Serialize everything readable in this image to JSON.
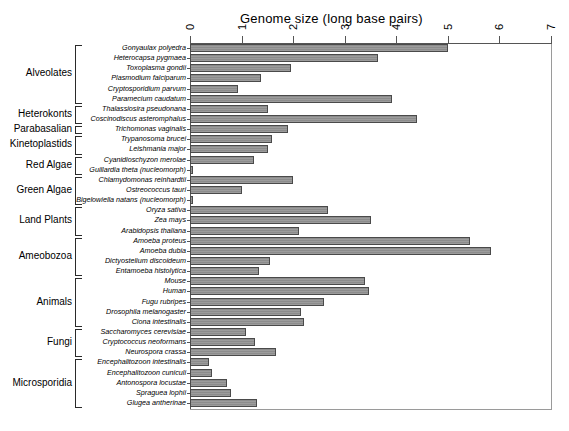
{
  "chart_data": {
    "type": "bar",
    "orientation": "horizontal",
    "title": "Genome size (long base pairs)",
    "xlabel": "",
    "ylabel": "",
    "xlim": [
      0,
      7
    ],
    "xticks": [
      0,
      1,
      2,
      3,
      4,
      5,
      6,
      7
    ],
    "xtick_labels": [
      "0",
      "1",
      "2",
      "3",
      "4",
      "5",
      "6",
      "7"
    ],
    "grid": false,
    "legend": "none",
    "bar_color": "#9c9c9c",
    "bar_edge_color": "#4a4a4a",
    "categories": [
      "Gonyaulax polyedra",
      "Heterocapsa pygmaea",
      "Toxoplasma gondii",
      "Plasmodium falciparum",
      "Cryptosporidium parvum",
      "Paramecium caudatum",
      "Thalassiosira pseudonana",
      "Coscinodiscus asteromphalus",
      "Trichomonas vaginalis",
      "Trypanosoma brucei",
      "Leishmania major",
      "Cyanidioschyzon merolae",
      "Guillardia theta (nucleomorph)",
      "Chlamydomonas reinhardtii",
      "Ostreococcus tauri",
      "Bigelowiella natans (nucleomorph)",
      "Oryza sativa",
      "Zea mays",
      "Arabidopsis thaliana",
      "Amoeba proteus",
      "Amoeba dubia",
      "Dictyostelium discoideum",
      "Entamoeba histolytica",
      "Mouse",
      "Human",
      "Fugu rubripes",
      "Drosophila melanogaster",
      "Ciona intestinalis",
      "Saccharomyces cerevisiae",
      "Cryptococcus neoformans",
      "Neurospora crassa",
      "Encephalitozoon intestinalis",
      "Encephalitozoon cuniculi",
      "Antonospora locustae",
      "Spraguea lophii",
      "Glugea antherinae"
    ],
    "values": [
      5.0,
      3.65,
      1.95,
      1.37,
      0.93,
      3.92,
      1.52,
      4.4,
      1.9,
      1.59,
      1.52,
      1.24,
      0.05,
      2.0,
      1.0,
      0.06,
      2.68,
      3.5,
      2.12,
      5.42,
      5.83,
      1.55,
      1.33,
      3.39,
      3.47,
      2.6,
      2.16,
      2.22,
      1.09,
      1.27,
      1.66,
      0.37,
      0.43,
      0.72,
      0.79,
      1.3
    ],
    "groups": [
      {
        "label": "Alveolates",
        "start": 0,
        "end": 5
      },
      {
        "label": "Heterokonts",
        "start": 6,
        "end": 7
      },
      {
        "label": "Parabasalian",
        "start": 8,
        "end": 8
      },
      {
        "label": "Kinetoplastids",
        "start": 9,
        "end": 10
      },
      {
        "label": "Red Algae",
        "start": 11,
        "end": 12
      },
      {
        "label": "Green Algae",
        "start": 13,
        "end": 15
      },
      {
        "label": "Land Plants",
        "start": 16,
        "end": 18
      },
      {
        "label": "Ameobozoa",
        "start": 19,
        "end": 22
      },
      {
        "label": "Animals",
        "start": 23,
        "end": 27
      },
      {
        "label": "Fungi",
        "start": 28,
        "end": 30
      },
      {
        "label": "Microsporidia",
        "start": 31,
        "end": 35
      }
    ]
  }
}
